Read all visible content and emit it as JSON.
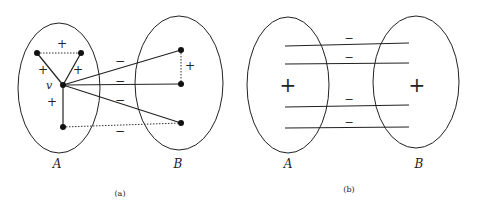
{
  "panels": [
    {
      "id": "a",
      "caption": "(a)",
      "sets": [
        {
          "label": "A",
          "cx": 59,
          "cy": 88,
          "rx": 41,
          "ry": 65,
          "label_x": 57,
          "label_y": 168
        },
        {
          "label": "B",
          "cx": 179,
          "cy": 83,
          "rx": 44,
          "ry": 67,
          "label_x": 178,
          "label_y": 168
        }
      ],
      "vertex_label": "v",
      "nodes": [
        {
          "id": "a1",
          "x": 37,
          "y": 53
        },
        {
          "id": "a2",
          "x": 81,
          "y": 53
        },
        {
          "id": "v",
          "x": 63,
          "y": 85
        },
        {
          "id": "a3",
          "x": 63,
          "y": 127
        },
        {
          "id": "b1",
          "x": 181,
          "y": 50
        },
        {
          "id": "b2",
          "x": 181,
          "y": 84
        },
        {
          "id": "b3",
          "x": 181,
          "y": 123
        }
      ],
      "edges": [
        {
          "from": "a1",
          "to": "a2",
          "style": "dotted",
          "sign": "+"
        },
        {
          "from": "a1",
          "to": "v",
          "style": "solid",
          "sign": "+"
        },
        {
          "from": "a2",
          "to": "v",
          "style": "solid",
          "sign": "+"
        },
        {
          "from": "v",
          "to": "a3",
          "style": "solid",
          "sign": "+"
        },
        {
          "from": "v",
          "to": "b1",
          "style": "solid",
          "sign": "−"
        },
        {
          "from": "v",
          "to": "b2",
          "style": "solid",
          "sign": "−"
        },
        {
          "from": "v",
          "to": "b3",
          "style": "solid",
          "sign": "−"
        },
        {
          "from": "a3",
          "to": "b3",
          "style": "dotted",
          "sign": "−"
        },
        {
          "from": "b1",
          "to": "b2",
          "style": "dotted",
          "sign": "+"
        }
      ],
      "sign_labels": {
        "plus_top": "+",
        "plus_left": "+",
        "plus_right": "+",
        "plus_lower": "+",
        "plus_b": "+",
        "minus_1": "−",
        "minus_2": "−",
        "minus_3": "−",
        "minus_4": "−"
      }
    },
    {
      "id": "b",
      "caption": "(b)",
      "sets": [
        {
          "label": "A",
          "cx": 288,
          "cy": 85,
          "rx": 41,
          "ry": 68,
          "label_x": 288,
          "label_y": 168,
          "inner_sign": "+"
        },
        {
          "label": "B",
          "cx": 416,
          "cy": 82,
          "rx": 43,
          "ry": 66,
          "label_x": 419,
          "label_y": 168,
          "inner_sign": "+"
        }
      ],
      "cross_edges": [
        {
          "y1": 46,
          "y2": 43,
          "sign": "−"
        },
        {
          "y1": 64,
          "y2": 63,
          "sign": "−"
        },
        {
          "y1": 107,
          "y2": 105,
          "sign": "−"
        },
        {
          "y1": 128,
          "y2": 127,
          "sign": "−"
        }
      ]
    }
  ]
}
